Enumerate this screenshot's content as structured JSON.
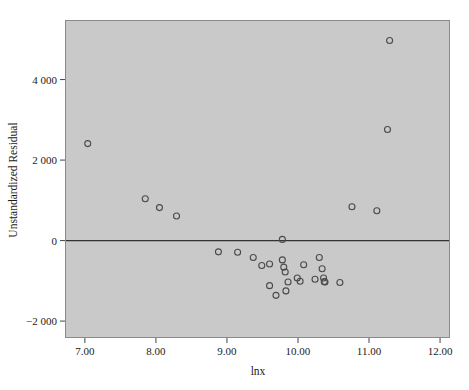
{
  "figure": {
    "type": "scatter-plot",
    "background_color": "#ffffff",
    "plot_area_color": "#c9c9c9",
    "frame_color": "#8a8a8a",
    "marker_color": "#4a4a4a",
    "text_color": "#1a1a1a"
  },
  "chart_data": {
    "type": "scatter",
    "title": "",
    "xlabel": "lnx",
    "ylabel": "Unstandardized Residual",
    "xlim": [
      6.72,
      12.14
    ],
    "ylim": [
      -2420,
      5480
    ],
    "xticks": [
      7.0,
      8.0,
      9.0,
      10.0,
      11.0,
      12.0
    ],
    "xtick_labels": [
      "7.00",
      "8.00",
      "9.00",
      "10.00",
      "11.00",
      "12.00"
    ],
    "yticks": [
      -2000,
      0,
      2000,
      4000
    ],
    "ytick_labels": [
      "−2 000",
      "0",
      "2 000",
      "4 000"
    ],
    "grid": false,
    "legend": null,
    "reference_line": {
      "axis": "y",
      "value": 0,
      "color": "#333333"
    },
    "marker": {
      "shape": "circle-open",
      "size": 5,
      "edge_color": "#4a4a4a",
      "fill": "none"
    },
    "series": [
      {
        "name": "Unstandardized Residual",
        "x": [
          7.04,
          7.85,
          8.05,
          8.29,
          8.88,
          9.15,
          9.37,
          9.49,
          9.6,
          9.78,
          9.8,
          9.82,
          9.83,
          9.86,
          9.6,
          9.69,
          9.76,
          9.82,
          9.88,
          9.99,
          10.03,
          10.08,
          10.24,
          10.3,
          10.34,
          10.36,
          10.37,
          10.38,
          10.59,
          10.76,
          11.11,
          11.26,
          11.29
        ],
        "y": [
          2410,
          1040,
          820,
          610,
          -280,
          -290,
          -420,
          -620,
          -580,
          -480,
          -660,
          -780,
          -1030,
          -1250,
          -1120,
          -1360,
          -1070,
          -1030,
          -950,
          -930,
          -600,
          -1010,
          -960,
          -420,
          -700,
          -930,
          -1020,
          -1030,
          -1040,
          840,
          740,
          2760,
          4970
        ]
      }
    ]
  },
  "points": [
    {
      "x": 7.04,
      "y": 2410
    },
    {
      "x": 7.85,
      "y": 1040
    },
    {
      "x": 8.05,
      "y": 820
    },
    {
      "x": 8.29,
      "y": 610
    },
    {
      "x": 8.88,
      "y": -280
    },
    {
      "x": 9.15,
      "y": -290
    },
    {
      "x": 9.37,
      "y": -420
    },
    {
      "x": 9.49,
      "y": -620
    },
    {
      "x": 9.6,
      "y": -580
    },
    {
      "x": 9.6,
      "y": -1120
    },
    {
      "x": 9.69,
      "y": -1360
    },
    {
      "x": 9.78,
      "y": -480
    },
    {
      "x": 9.78,
      "y": 30
    },
    {
      "x": 9.8,
      "y": -660
    },
    {
      "x": 9.82,
      "y": -780
    },
    {
      "x": 9.83,
      "y": -1250
    },
    {
      "x": 9.86,
      "y": -1030
    },
    {
      "x": 9.99,
      "y": -930
    },
    {
      "x": 10.03,
      "y": -1010
    },
    {
      "x": 10.08,
      "y": -600
    },
    {
      "x": 10.24,
      "y": -960
    },
    {
      "x": 10.3,
      "y": -420
    },
    {
      "x": 10.34,
      "y": -700
    },
    {
      "x": 10.36,
      "y": -930
    },
    {
      "x": 10.37,
      "y": -1020
    },
    {
      "x": 10.38,
      "y": -1030
    },
    {
      "x": 10.59,
      "y": -1040
    },
    {
      "x": 10.76,
      "y": 840
    },
    {
      "x": 11.11,
      "y": 740
    },
    {
      "x": 11.26,
      "y": 2760
    },
    {
      "x": 11.29,
      "y": 4970
    }
  ],
  "axes": {
    "x_title": "lnx",
    "y_title": "Unstandardized Residual",
    "x_tick_labels": [
      "7.00",
      "8.00",
      "9.00",
      "10.00",
      "11.00",
      "12.00"
    ],
    "y_tick_labels": [
      "4 000",
      "2 000",
      "0",
      "−2 000"
    ]
  }
}
